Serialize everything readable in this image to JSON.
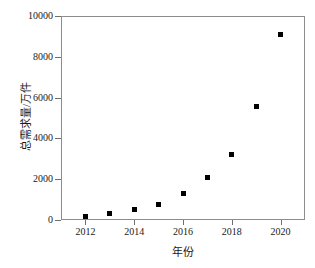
{
  "chart_data": {
    "type": "scatter",
    "title": "",
    "xlabel": "年份",
    "ylabel": "总需求量/万件",
    "x": [
      2012,
      2013,
      2014,
      2015,
      2016,
      2017,
      2018,
      2019,
      2020
    ],
    "values": [
      180,
      300,
      500,
      780,
      1280,
      2080,
      3200,
      5550,
      9100
    ],
    "series": [
      {
        "name": "总需求量",
        "values": [
          180,
          300,
          500,
          780,
          1280,
          2080,
          3200,
          5550,
          9100
        ]
      }
    ],
    "xlim": [
      2011,
      2021
    ],
    "ylim": [
      0,
      10000
    ],
    "xticks": [
      2012,
      2014,
      2016,
      2018,
      2020
    ],
    "xtick_labels": [
      "2012",
      "2014",
      "2016",
      "2018",
      "2020"
    ],
    "yticks": [
      0,
      2000,
      4000,
      6000,
      8000,
      10000
    ],
    "ytick_labels": [
      "0",
      "2000",
      "4000",
      "6000",
      "8000",
      "10000"
    ],
    "grid": false,
    "legend": false,
    "marker": "square",
    "marker_color": "#000000",
    "axis_color": "#8d8d8d",
    "background": "#ffffff"
  }
}
